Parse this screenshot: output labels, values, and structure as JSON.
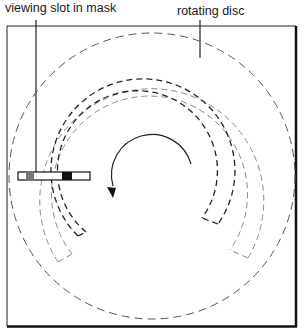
{
  "labels": {
    "viewing_slot": "viewing slot in mask",
    "rotating_disc": "rotating disc"
  },
  "colors": {
    "ink": "#1a1a1a",
    "grey_track": "#8a8a8a",
    "slot_grey": "#777777",
    "slot_black": "#111111"
  }
}
